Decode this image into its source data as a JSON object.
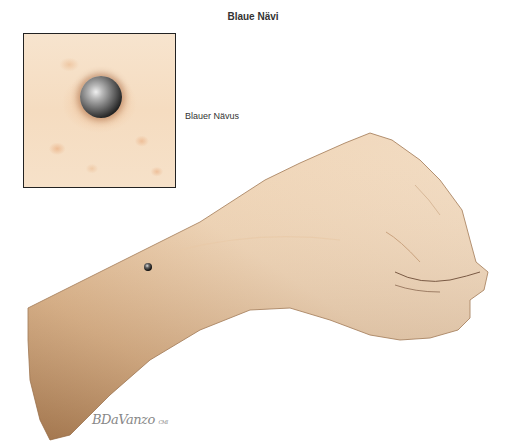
{
  "title": "Blaue Nävi",
  "inset": {
    "label": "Blauer Nävus",
    "description": "Magnified view of a blue nevus on skin"
  },
  "illustration": {
    "subject": "Forearm and clenched fist with small blue nevus on wrist",
    "skin_color": "#e9c9a3",
    "mole_color": "#3a3a3a"
  },
  "signature": {
    "name": "BDaVanzo",
    "suffix": "CMI"
  }
}
